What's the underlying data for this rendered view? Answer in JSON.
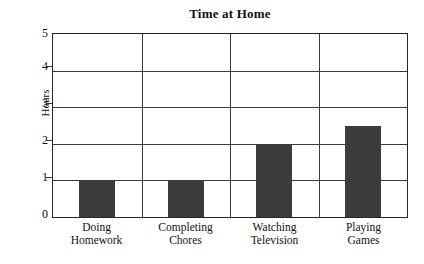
{
  "chart_data": {
    "type": "bar",
    "title": "Time at Home",
    "xlabel": "",
    "ylabel": "Hours",
    "categories": [
      "Doing Homework",
      "Completing Chores",
      "Watching Television",
      "Playing Games"
    ],
    "category_lines": [
      [
        "Doing",
        "Homework"
      ],
      [
        "Completing",
        "Chores"
      ],
      [
        "Watching",
        "Television"
      ],
      [
        "Playing",
        "Games"
      ]
    ],
    "values": [
      1,
      1,
      2,
      2.5
    ],
    "ylim": [
      0,
      5
    ],
    "ytick_labels": [
      "0",
      "1",
      "2",
      "3",
      "4",
      "5"
    ],
    "ytick_values": [
      0,
      1,
      2,
      3,
      4,
      5
    ],
    "grid": true,
    "grid_orientation": "horizontal-and-category-dividers",
    "legend": "none",
    "bar_color": "#3c3c3c",
    "axis_color": "#3b3b3b",
    "background_color": "#ffffff"
  },
  "figure": {
    "frame_border_color": "#262626"
  }
}
